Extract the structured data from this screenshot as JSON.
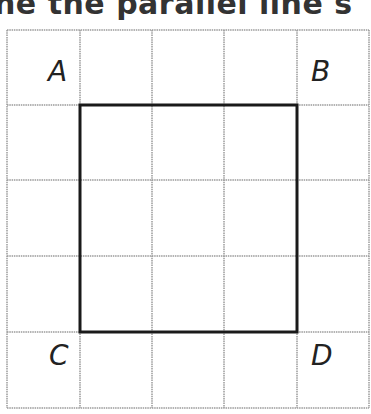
{
  "title": "ne the parallel line s",
  "grid": {
    "x_lines": [
      7,
      80,
      152,
      224,
      297,
      369
    ],
    "y_lines": [
      30,
      105,
      180,
      256,
      332,
      408
    ],
    "grid_color": "#9a9a9a",
    "square_color": "#1a1a1a"
  },
  "square": {
    "x1": 80,
    "y1": 105,
    "x2": 297,
    "y2": 332
  },
  "points": [
    {
      "name": "A",
      "label": "A",
      "x": 48,
      "y": 58
    },
    {
      "name": "B",
      "label": "B",
      "x": 311,
      "y": 58
    },
    {
      "name": "C",
      "label": "C",
      "x": 49,
      "y": 342
    },
    {
      "name": "D",
      "label": "D",
      "x": 311,
      "y": 342
    }
  ]
}
